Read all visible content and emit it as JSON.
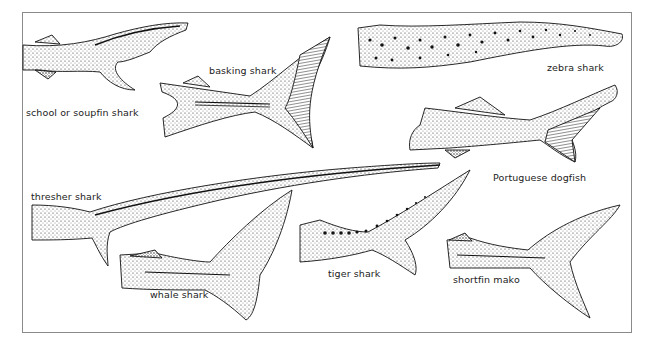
{
  "figure": {
    "frame_color": "#8a8a8a",
    "ink_color": "#1a1a1a",
    "labels": [
      {
        "id": "school",
        "text": "school or soupfin shark",
        "x": 26,
        "y": 107
      },
      {
        "id": "basking",
        "text": "basking shark",
        "x": 209,
        "y": 65
      },
      {
        "id": "zebra",
        "text": "zebra shark",
        "x": 547,
        "y": 62
      },
      {
        "id": "portuguese",
        "text": "Portuguese dogfish",
        "x": 493,
        "y": 172
      },
      {
        "id": "thresher",
        "text": "thresher shark",
        "x": 31,
        "y": 191
      },
      {
        "id": "whale",
        "text": "whale shark",
        "x": 150,
        "y": 289
      },
      {
        "id": "tiger",
        "text": "tiger shark",
        "x": 328,
        "y": 268
      },
      {
        "id": "mako",
        "text": "shortfin mako",
        "x": 453,
        "y": 274
      }
    ]
  }
}
